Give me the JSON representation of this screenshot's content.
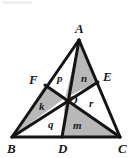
{
  "figure": {
    "width": 132,
    "height": 158,
    "background_color": "#ffffff",
    "stroke_color": "#141414",
    "shade_color": "#b8b8b8",
    "unshaded_color": "#ffffff",
    "stroke_width": 3
  },
  "vertices": [
    {
      "id": "A",
      "label": "A",
      "x": 79,
      "y": 40,
      "label_x": 75,
      "label_y": 22
    },
    {
      "id": "B",
      "label": "B",
      "x": 12,
      "y": 137,
      "label_x": 7,
      "label_y": 142
    },
    {
      "id": "C",
      "label": "C",
      "x": 120,
      "y": 137,
      "label_x": 118,
      "label_y": 142
    },
    {
      "id": "D",
      "label": "D",
      "x": 62,
      "y": 137,
      "label_x": 58,
      "label_y": 142
    },
    {
      "id": "E",
      "label": "E",
      "x": 98,
      "y": 82,
      "label_x": 103,
      "label_y": 70
    },
    {
      "id": "F",
      "label": "F",
      "x": 45,
      "y": 85,
      "label_x": 29,
      "label_y": 73
    },
    {
      "id": "O",
      "label": "O",
      "x": 65,
      "y": 98,
      "label_x": 69,
      "label_y": 94
    }
  ],
  "regions": [
    {
      "id": "p",
      "label": "p",
      "corners": "A,F,O",
      "shaded": false,
      "label_x": 57,
      "label_y": 73
    },
    {
      "id": "n",
      "label": "n",
      "corners": "A,O,E",
      "shaded": true,
      "label_x": 81,
      "label_y": 73
    },
    {
      "id": "k",
      "label": "k",
      "corners": "F,B,O",
      "shaded": true,
      "label_x": 39,
      "label_y": 101
    },
    {
      "id": "q",
      "label": "q",
      "corners": "B,O,D",
      "shaded": false,
      "label_x": 48,
      "label_y": 119
    },
    {
      "id": "m",
      "label": "m",
      "corners": "D,O,C",
      "shaded": true,
      "label_x": 73,
      "label_y": 120
    },
    {
      "id": "r",
      "label": "r",
      "corners": "O,E,C",
      "shaded": false,
      "label_x": 89,
      "label_y": 98
    }
  ],
  "segments": [
    {
      "id": "AB",
      "from": "A",
      "to": "B",
      "kind": "side"
    },
    {
      "id": "BC",
      "from": "B",
      "to": "C",
      "kind": "side"
    },
    {
      "id": "CA",
      "from": "C",
      "to": "A",
      "kind": "side"
    },
    {
      "id": "AD",
      "from": "A",
      "to": "D",
      "kind": "cevian"
    },
    {
      "id": "BE",
      "from": "B",
      "to": "E",
      "kind": "cevian"
    },
    {
      "id": "CF",
      "from": "C",
      "to": "F",
      "kind": "cevian"
    }
  ]
}
